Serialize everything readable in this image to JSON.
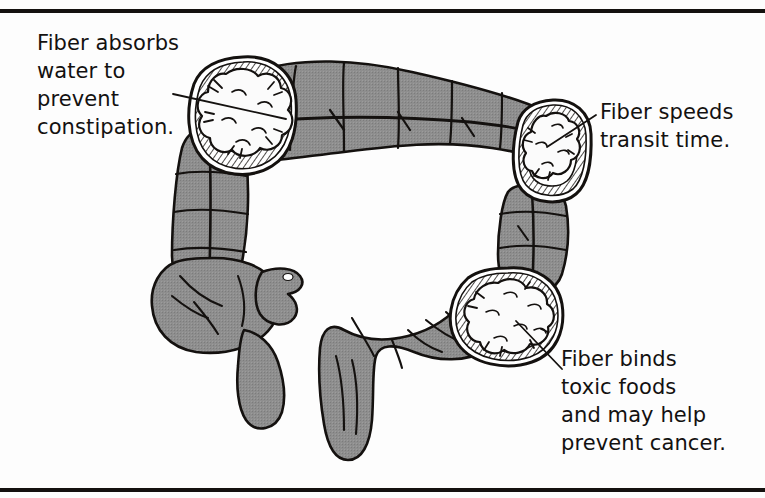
{
  "figure": {
    "background_color": "#fdfdfd",
    "ink_color": "#14110f",
    "tissue_fill_color": "#8e8e8e",
    "tissue_shadow_color": "#6f6f6f",
    "lumen_fill_color": "#fbfbfb",
    "rules": {
      "top_label": "top-rule",
      "bottom_label": "bottom-rule",
      "color": "#14110f"
    }
  },
  "callouts": [
    {
      "id": "absorbs",
      "text": "Fiber absorbs\nwater to\nprevent\nconstipation.",
      "lines": [
        "Fiber absorbs",
        "water to",
        "prevent",
        "constipation."
      ],
      "leader_from": [
        175,
        95
      ],
      "leader_to": [
        243,
        113
      ],
      "anchor": "hepatic-flexure-cross-section"
    },
    {
      "id": "transit",
      "text": "Fiber speeds\ntransit time.",
      "lines": [
        "Fiber speeds",
        "transit time."
      ],
      "leader_from": [
        596,
        116
      ],
      "leader_to": [
        552,
        144
      ],
      "anchor": "splenic-flexure-cross-section"
    },
    {
      "id": "binds",
      "text": "Fiber binds\ntoxic foods\nand may help\nprevent cancer.",
      "lines": [
        "Fiber binds",
        "toxic foods",
        "and may help",
        "prevent cancer."
      ],
      "leader_from": [
        561,
        368
      ],
      "leader_to": [
        516,
        322
      ],
      "anchor": "sigmoid-cross-section"
    }
  ],
  "anatomy": {
    "parts": [
      {
        "name": "transverse-colon",
        "label": "Transverse colon"
      },
      {
        "name": "ascending-colon",
        "label": "Ascending colon"
      },
      {
        "name": "descending-colon",
        "label": "Descending colon"
      },
      {
        "name": "cecum",
        "label": "Cecum"
      },
      {
        "name": "appendix",
        "label": "Appendix"
      },
      {
        "name": "sigmoid-colon",
        "label": "Sigmoid colon"
      },
      {
        "name": "rectum",
        "label": "Rectum"
      }
    ],
    "cross_sections": [
      {
        "name": "hepatic-flexure-cross-section",
        "center": [
          243,
          113
        ],
        "fiber_mass": "fiber bolus"
      },
      {
        "name": "splenic-flexure-cross-section",
        "center": [
          553,
          150
        ],
        "fiber_mass": "fiber bolus"
      },
      {
        "name": "sigmoid-cross-section",
        "center": [
          508,
          318
        ],
        "fiber_mass": "fiber bolus"
      }
    ]
  }
}
